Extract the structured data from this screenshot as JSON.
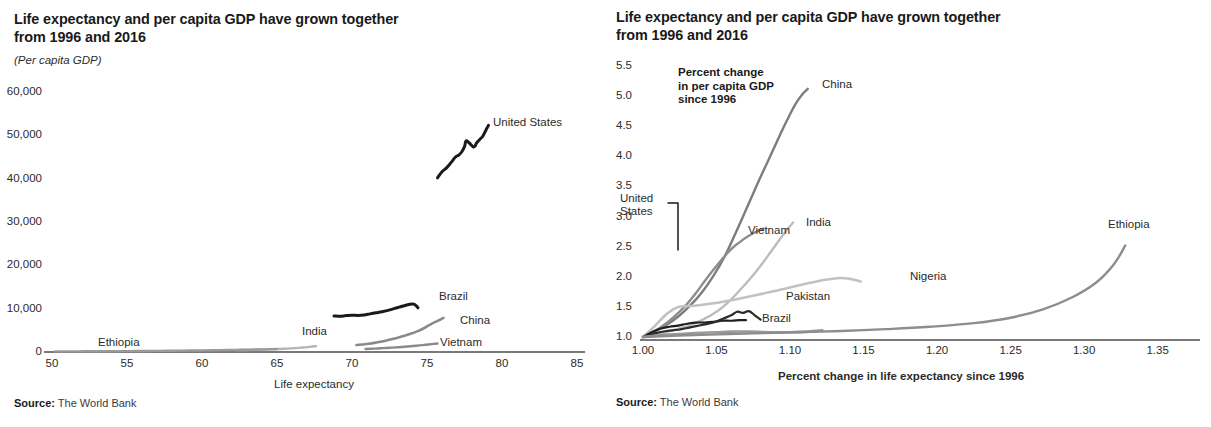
{
  "figures": [
    {
      "id": "left",
      "title": "Life expectancy and per capita GDP have grown together\nfrom 1996 and 2016",
      "unit_note": "(Per capita GDP)",
      "source_prefix": "Source:",
      "source_text": " The World Bank",
      "xlabel": "Life expectancy",
      "ylabel": "",
      "yticks": [
        "60,000",
        "50,000",
        "40,000",
        "30,000",
        "20,000",
        "10,000",
        "0"
      ],
      "xticks": [
        "50",
        "55",
        "60",
        "65",
        "70",
        "75",
        "80",
        "85"
      ],
      "series_labels": [
        "United States",
        "Brazil",
        "China",
        "Vietnam",
        "India",
        "Ethiopia"
      ]
    },
    {
      "id": "right",
      "title": "Life expectancy and per capita GDP have grown together\nfrom 1996 and 2016",
      "unit_note": "",
      "source_prefix": "Source:",
      "source_text": " The World Bank",
      "xlabel": "Percent change in life expectancy since 1996",
      "annotation": "Percent change\nin per capita GDP\nsince 1996",
      "yticks": [
        "5.5",
        "5.0",
        "4.5",
        "4.0",
        "3.5",
        "3.0",
        "2.5",
        "2.0",
        "1.5",
        "1.0"
      ],
      "xticks": [
        "1.00",
        "1.05",
        "1.10",
        "1.15",
        "1.20",
        "1.25",
        "1.30",
        "1.35"
      ],
      "series_labels": [
        "China",
        "India",
        "Vietnam",
        "United\nStates",
        "Pakistan",
        "Brazil",
        "Nigeria",
        "Ethiopia"
      ]
    }
  ],
  "chart_data": [
    {
      "type": "line",
      "title": "Life expectancy and per capita GDP have grown together from 1996 and 2016",
      "subtitle": "(Per capita GDP)",
      "xlabel": "Life expectancy",
      "ylabel": "(Per capita GDP)",
      "xlim": [
        50,
        85
      ],
      "ylim": [
        0,
        60000
      ],
      "xticks": [
        50,
        55,
        60,
        65,
        70,
        75,
        80,
        85
      ],
      "yticks": [
        0,
        10000,
        20000,
        30000,
        40000,
        50000,
        60000
      ],
      "grid": false,
      "legend": "inline-labels",
      "source": "Source: The World Bank",
      "series": [
        {
          "name": "United States",
          "color": "#1a1a1a",
          "x": [
            75.7,
            76.0,
            76.3,
            76.6,
            76.9,
            77.1,
            77.3,
            77.5,
            77.6,
            77.8,
            78.0,
            78.1,
            78.2,
            78.3,
            78.5,
            78.7,
            78.8,
            78.9,
            79.0,
            79.1
          ],
          "y": [
            40200,
            41600,
            42500,
            43700,
            45000,
            45400,
            46100,
            47400,
            48700,
            48300,
            47600,
            47300,
            47500,
            48200,
            49000,
            49700,
            50300,
            51000,
            51700,
            52300
          ]
        },
        {
          "name": "Brazil",
          "color": "#1a1a1a",
          "x": [
            68.8,
            69.2,
            69.6,
            70.0,
            70.4,
            70.8,
            71.2,
            71.6,
            72.0,
            72.4,
            72.8,
            73.2,
            73.6,
            74.0,
            74.2,
            74.4
          ],
          "y": [
            8300,
            8250,
            8400,
            8500,
            8450,
            8550,
            8800,
            9050,
            9300,
            9600,
            10000,
            10400,
            10800,
            11100,
            10900,
            10200
          ]
        },
        {
          "name": "China",
          "color": "#8a8a8a",
          "x": [
            70.3,
            70.7,
            71.1,
            71.5,
            71.9,
            72.3,
            72.7,
            73.1,
            73.5,
            73.9,
            74.3,
            74.7,
            75.0,
            75.3,
            75.6,
            75.9,
            76.1
          ],
          "y": [
            1600,
            1750,
            1900,
            2100,
            2350,
            2650,
            3000,
            3350,
            3750,
            4200,
            4700,
            5300,
            5900,
            6500,
            7000,
            7500,
            7900
          ]
        },
        {
          "name": "Vietnam",
          "color": "#8a8a8a",
          "x": [
            70.9,
            71.3,
            71.7,
            72.1,
            72.5,
            72.9,
            73.3,
            73.7,
            74.1,
            74.5,
            74.9,
            75.3,
            75.7
          ],
          "y": [
            700,
            760,
            820,
            890,
            970,
            1060,
            1160,
            1270,
            1390,
            1520,
            1660,
            1810,
            1960
          ]
        },
        {
          "name": "India",
          "color": "#b5b5b5",
          "x": [
            62.2,
            62.7,
            63.2,
            63.7,
            64.2,
            64.7,
            65.2,
            65.7,
            66.2,
            66.7,
            67.2,
            67.6
          ],
          "y": [
            430,
            450,
            480,
            520,
            570,
            630,
            700,
            790,
            900,
            1030,
            1180,
            1350
          ]
        },
        {
          "name": "Ethiopia",
          "color": "#9a9a9a",
          "x": [
            50.2,
            51.2,
            52.2,
            53.2,
            54.2,
            55.2,
            56.2,
            57.2,
            58.2,
            59.2,
            60.2,
            61.2,
            62.2,
            63.2,
            64.2,
            65.0
          ],
          "y": [
            140,
            150,
            160,
            175,
            190,
            210,
            235,
            265,
            300,
            340,
            385,
            435,
            490,
            550,
            615,
            680
          ]
        }
      ]
    },
    {
      "type": "line",
      "title": "Life expectancy and per capita GDP have grown together from 1996 and 2016",
      "annotation": "Percent change in per capita GDP since 1996",
      "xlabel": "Percent change in life expectancy since 1996",
      "ylabel": "Percent change in per capita GDP since 1996",
      "xlim": [
        1.0,
        1.355
      ],
      "ylim": [
        1.0,
        5.55
      ],
      "xticks": [
        1.0,
        1.05,
        1.1,
        1.15,
        1.2,
        1.25,
        1.3,
        1.35
      ],
      "yticks": [
        1.0,
        1.5,
        2.0,
        2.5,
        3.0,
        3.5,
        4.0,
        4.5,
        5.0,
        5.5
      ],
      "grid": false,
      "legend": "inline-labels",
      "source": "Source: The World Bank",
      "series": [
        {
          "name": "China",
          "color": "#7d7d7d",
          "x": [
            1.0,
            1.008,
            1.016,
            1.024,
            1.032,
            1.04,
            1.048,
            1.056,
            1.064,
            1.072,
            1.08,
            1.088,
            1.094,
            1.1,
            1.104,
            1.108,
            1.112
          ],
          "y": [
            1.0,
            1.09,
            1.2,
            1.34,
            1.52,
            1.74,
            2.02,
            2.36,
            2.78,
            3.22,
            3.66,
            4.08,
            4.4,
            4.7,
            4.88,
            5.02,
            5.12
          ]
        },
        {
          "name": "Vietnam",
          "color": "#8d8d8d",
          "x": [
            1.0,
            1.006,
            1.012,
            1.018,
            1.024,
            1.03,
            1.036,
            1.042,
            1.048,
            1.054,
            1.06,
            1.066,
            1.072,
            1.078,
            1.082
          ],
          "y": [
            1.0,
            1.07,
            1.16,
            1.27,
            1.4,
            1.55,
            1.73,
            1.93,
            2.12,
            2.3,
            2.46,
            2.58,
            2.68,
            2.76,
            2.8
          ]
        },
        {
          "name": "India",
          "color": "#bdbdbd",
          "x": [
            1.0,
            1.01,
            1.02,
            1.03,
            1.04,
            1.05,
            1.058,
            1.066,
            1.074,
            1.082,
            1.09,
            1.096,
            1.102
          ],
          "y": [
            1.0,
            1.05,
            1.11,
            1.18,
            1.28,
            1.42,
            1.58,
            1.78,
            2.0,
            2.25,
            2.52,
            2.72,
            2.9
          ]
        },
        {
          "name": "Nigeria",
          "color": "#c2c2c2",
          "x": [
            1.0,
            1.008,
            1.016,
            1.024,
            1.035,
            1.048,
            1.062,
            1.078,
            1.094,
            1.11,
            1.124,
            1.134,
            1.142,
            1.148
          ],
          "y": [
            1.0,
            1.18,
            1.38,
            1.5,
            1.52,
            1.56,
            1.62,
            1.7,
            1.79,
            1.88,
            1.95,
            1.98,
            1.96,
            1.92
          ]
        },
        {
          "name": "United States",
          "color": "#1f1f1f",
          "x": [
            1.0,
            1.006,
            1.012,
            1.018,
            1.024,
            1.03,
            1.036,
            1.042,
            1.048,
            1.054,
            1.06,
            1.066,
            1.07
          ],
          "y": [
            1.0,
            1.08,
            1.14,
            1.17,
            1.19,
            1.22,
            1.24,
            1.24,
            1.25,
            1.27,
            1.27,
            1.28,
            1.28
          ]
        },
        {
          "name": "Pakistan",
          "color": "#2b2b2b",
          "x": [
            1.0,
            1.008,
            1.016,
            1.024,
            1.032,
            1.04,
            1.048,
            1.054,
            1.06,
            1.064,
            1.068,
            1.072,
            1.076,
            1.08
          ],
          "y": [
            1.0,
            1.06,
            1.1,
            1.12,
            1.16,
            1.2,
            1.24,
            1.3,
            1.36,
            1.42,
            1.4,
            1.43,
            1.36,
            1.29
          ]
        },
        {
          "name": "Brazil",
          "color": "#9a9a9a",
          "x": [
            1.0,
            1.008,
            1.016,
            1.024,
            1.032,
            1.04,
            1.05,
            1.06,
            1.072,
            1.086,
            1.1,
            1.112,
            1.122
          ],
          "y": [
            1.0,
            1.02,
            1.04,
            1.05,
            1.06,
            1.07,
            1.08,
            1.09,
            1.09,
            1.08,
            1.08,
            1.09,
            1.11
          ]
        },
        {
          "name": "Ethiopia",
          "color": "#8d8d8d",
          "x": [
            1.0,
            1.02,
            1.045,
            1.075,
            1.105,
            1.135,
            1.165,
            1.195,
            1.225,
            1.25,
            1.272,
            1.292,
            1.308,
            1.32,
            1.328
          ],
          "y": [
            1.0,
            1.02,
            1.04,
            1.06,
            1.08,
            1.1,
            1.13,
            1.17,
            1.23,
            1.32,
            1.46,
            1.66,
            1.9,
            2.2,
            2.52
          ]
        }
      ]
    }
  ]
}
